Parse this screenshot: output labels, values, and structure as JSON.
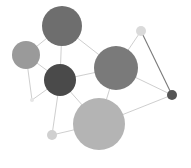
{
  "diagram": {
    "type": "network-graph",
    "width": 191,
    "height": 168,
    "background": "#ffffff",
    "edge_color": "#c8c8c8",
    "nodes": [
      {
        "id": "top",
        "cx": 62,
        "cy": 26,
        "r": 20,
        "fill": "#6e6e6e"
      },
      {
        "id": "left",
        "cx": 26,
        "cy": 55,
        "r": 14,
        "fill": "#9a9a9a"
      },
      {
        "id": "dark-center",
        "cx": 60,
        "cy": 80,
        "r": 16,
        "fill": "#4a4a4a"
      },
      {
        "id": "mid-right",
        "cx": 116,
        "cy": 68,
        "r": 22,
        "fill": "#7a7a7a"
      },
      {
        "id": "bottom-large",
        "cx": 99,
        "cy": 124,
        "r": 26,
        "fill": "#b4b4b4"
      },
      {
        "id": "top-right-small",
        "cx": 141,
        "cy": 31,
        "r": 5,
        "fill": "#dadada"
      },
      {
        "id": "right-small-dark",
        "cx": 172,
        "cy": 95,
        "r": 5,
        "fill": "#555555"
      },
      {
        "id": "left-tiny",
        "cx": 32,
        "cy": 100,
        "r": 2,
        "fill": "#e6e6e6"
      },
      {
        "id": "bottom-left-small",
        "cx": 52,
        "cy": 135,
        "r": 5,
        "fill": "#d0d0d0"
      }
    ],
    "edges": [
      {
        "from": "top",
        "to": "left",
        "color": "#c8c8c8"
      },
      {
        "from": "top",
        "to": "dark-center",
        "color": "#c8c8c8"
      },
      {
        "from": "top",
        "to": "mid-right",
        "color": "#c8c8c8"
      },
      {
        "from": "left",
        "to": "dark-center",
        "color": "#c8c8c8"
      },
      {
        "from": "left",
        "to": "left-tiny",
        "color": "#c8c8c8"
      },
      {
        "from": "left-tiny",
        "to": "dark-center",
        "color": "#c8c8c8"
      },
      {
        "from": "dark-center",
        "to": "mid-right",
        "color": "#c8c8c8"
      },
      {
        "from": "dark-center",
        "to": "bottom-large",
        "color": "#c8c8c8"
      },
      {
        "from": "dark-center",
        "to": "bottom-left-small",
        "color": "#c8c8c8"
      },
      {
        "from": "bottom-left-small",
        "to": "bottom-large",
        "color": "#c8c8c8"
      },
      {
        "from": "mid-right",
        "to": "bottom-large",
        "color": "#c8c8c8"
      },
      {
        "from": "mid-right",
        "to": "top-right-small",
        "color": "#c8c8c8"
      },
      {
        "from": "mid-right",
        "to": "right-small-dark",
        "color": "#c8c8c8"
      },
      {
        "from": "top-right-small",
        "to": "right-small-dark",
        "color": "#7a7a7a"
      },
      {
        "from": "bottom-large",
        "to": "right-small-dark",
        "color": "#c8c8c8"
      }
    ]
  }
}
